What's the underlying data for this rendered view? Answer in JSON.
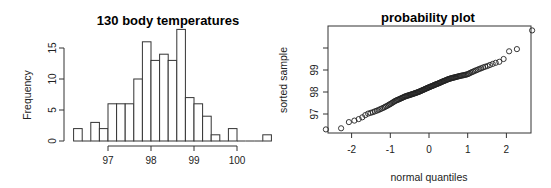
{
  "chart_data": [
    {
      "type": "bar",
      "subtype": "histogram",
      "title": "130 body temperatures",
      "xlabel": "",
      "ylabel": "Frequency",
      "bin_start": 96.2,
      "bin_width": 0.2,
      "bins": [
        [
          96.2,
          96.4
        ],
        [
          96.4,
          96.6
        ],
        [
          96.6,
          96.8
        ],
        [
          96.8,
          97.0
        ],
        [
          97.0,
          97.2
        ],
        [
          97.2,
          97.4
        ],
        [
          97.4,
          97.6
        ],
        [
          97.6,
          97.8
        ],
        [
          97.8,
          98.0
        ],
        [
          98.0,
          98.2
        ],
        [
          98.2,
          98.4
        ],
        [
          98.4,
          98.6
        ],
        [
          98.6,
          98.8
        ],
        [
          98.8,
          99.0
        ],
        [
          99.0,
          99.2
        ],
        [
          99.2,
          99.4
        ],
        [
          99.4,
          99.6
        ],
        [
          99.6,
          99.8
        ],
        [
          99.8,
          100.0
        ],
        [
          100.0,
          100.2
        ],
        [
          100.2,
          100.4
        ],
        [
          100.4,
          100.6
        ],
        [
          100.6,
          100.8
        ]
      ],
      "values": [
        2,
        0,
        3,
        2,
        6,
        6,
        6,
        10,
        16,
        13,
        14,
        13,
        18,
        7,
        6,
        4,
        1,
        0,
        2,
        0,
        0,
        0,
        1
      ],
      "xticks": [
        "97",
        "98",
        "99",
        "100"
      ],
      "yticks": [
        "0",
        "5",
        "10",
        "15"
      ],
      "ylim": [
        0,
        18
      ],
      "grid": false,
      "legend": null
    },
    {
      "type": "scatter",
      "subtype": "normal-qq",
      "title": "probability plot",
      "xlabel": "normal quantiles",
      "ylabel": "sorted sample",
      "xticks": [
        "-2",
        "-1",
        "0",
        "1",
        "2"
      ],
      "yticks": [
        "97",
        "98",
        "99",
        ""
      ],
      "xlim": [
        -2.6,
        2.6
      ],
      "ylim": [
        96.1,
        100.9
      ],
      "grid": false,
      "legend": null,
      "n": 130,
      "points_description": "Sorted sample of 130 temperatures plotted against normal quantiles; roughly linear from (-2.42, 96.3) to (2.42, 100.8)",
      "sample_counts_by_value_bin": "same as histogram values"
    }
  ],
  "labels": {
    "hist_title": "130 body temperatures",
    "hist_ylabel": "Frequency",
    "qq_title": "probability plot",
    "qq_xlabel": "normal quantiles",
    "qq_ylabel": "sorted sample"
  }
}
